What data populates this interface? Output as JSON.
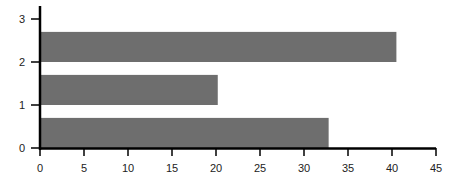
{
  "chart_data": {
    "type": "bar",
    "orientation": "horizontal",
    "title": "",
    "xlabel": "",
    "ylabel": "",
    "categories": [
      0,
      1,
      2
    ],
    "values": [
      32.8,
      20.2,
      40.5
    ],
    "bar_height": 0.7,
    "bar_align": "edge",
    "xlim": [
      0,
      45
    ],
    "ylim": [
      0,
      3.3
    ],
    "xticks": [
      0,
      5,
      10,
      15,
      20,
      25,
      30,
      35,
      40,
      45
    ],
    "yticks": [
      0,
      1,
      2,
      3
    ],
    "grid": false,
    "legend": null,
    "colors": {
      "bar": "#6e6e6e",
      "axis": "#000000",
      "text": "#222222"
    }
  }
}
